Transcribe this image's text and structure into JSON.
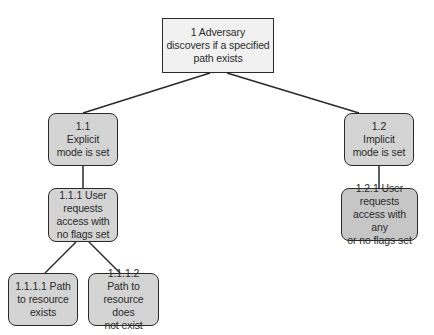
{
  "diagram": {
    "type": "attack-tree",
    "nodes": [
      {
        "id": "1",
        "label": "1 Adversary\ndiscovers if a specified\npath exists",
        "x": 162,
        "y": 18,
        "w": 112,
        "h": 55,
        "style": "root"
      },
      {
        "id": "1.1",
        "label": "1.1\nExplicit\nmode is set",
        "x": 48,
        "y": 113,
        "w": 70,
        "h": 53,
        "style": "child"
      },
      {
        "id": "1.2",
        "label": "1.2\nImplicit\nmode is set",
        "x": 344,
        "y": 113,
        "w": 70,
        "h": 53,
        "style": "child"
      },
      {
        "id": "1.1.1",
        "label": "1.1.1 User\nrequests\naccess with\nno flags set",
        "x": 48,
        "y": 188,
        "w": 70,
        "h": 54,
        "style": "child"
      },
      {
        "id": "1.2.1",
        "label": "1.2.1 User\nrequests\naccess with any\nor no flags set",
        "x": 341,
        "y": 188,
        "w": 77,
        "h": 53,
        "style": "child dark"
      },
      {
        "id": "1.1.1.1",
        "label": "1.1.1.1 Path\nto resource\nexists",
        "x": 8,
        "y": 273,
        "w": 70,
        "h": 53,
        "style": "child"
      },
      {
        "id": "1.1.1.2",
        "label": "1.1.1.2\nPath to\nresource does\nnot exist",
        "x": 88,
        "y": 273,
        "w": 71,
        "h": 53,
        "style": "child"
      }
    ],
    "edges": [
      {
        "from": "1",
        "to": "1.1",
        "x1": 210,
        "y1": 73,
        "x2": 83,
        "y2": 113
      },
      {
        "from": "1",
        "to": "1.2",
        "x1": 227,
        "y1": 73,
        "x2": 359,
        "y2": 113
      },
      {
        "from": "1.1",
        "to": "1.1.1",
        "x1": 83,
        "y1": 166,
        "x2": 83,
        "y2": 188
      },
      {
        "from": "1.2",
        "to": "1.2.1",
        "x1": 379,
        "y1": 166,
        "x2": 379,
        "y2": 188
      },
      {
        "from": "1.1.1",
        "to": "1.1.1.1",
        "x1": 76,
        "y1": 242,
        "x2": 45,
        "y2": 273
      },
      {
        "from": "1.1.1",
        "to": "1.1.1.2",
        "x1": 89,
        "y1": 242,
        "x2": 120,
        "y2": 273
      }
    ],
    "colors": {
      "root_fill": "#f1f1f1",
      "node_fill": "#d4d4d4",
      "node_fill_dark": "#c6c6c6",
      "stroke": "#2a2a2a",
      "text": "#2a2a2a"
    }
  }
}
